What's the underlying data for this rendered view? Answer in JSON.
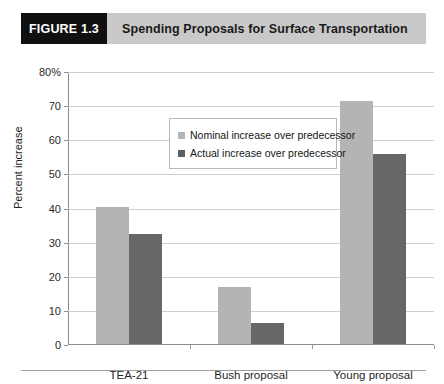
{
  "figure": {
    "number_label": "FIGURE 1.3",
    "title": "Spending Proposals for Surface Transportation"
  },
  "chart_data": {
    "type": "bar",
    "title": "Spending Proposals for Surface Transportation",
    "xlabel": "",
    "ylabel": "Percent increase",
    "categories": [
      "TEA-21",
      "Bush proposal",
      "Young proposal"
    ],
    "series": [
      {
        "name": "Nominal increase over predecessor",
        "color": "#b4b4b4",
        "values": [
          40.5,
          17,
          71.5
        ]
      },
      {
        "name": "Actual increase over predecessor",
        "color": "#676767",
        "values": [
          32.5,
          6.5,
          56
        ]
      }
    ],
    "ylim": [
      0,
      80
    ],
    "yticks": [
      0,
      10,
      20,
      30,
      40,
      50,
      60,
      70,
      80
    ],
    "ytick_labels": [
      "0",
      "10",
      "20",
      "30",
      "40",
      "50",
      "60",
      "70",
      "80%"
    ],
    "grid": true,
    "legend_position": "upper-left-inside"
  }
}
